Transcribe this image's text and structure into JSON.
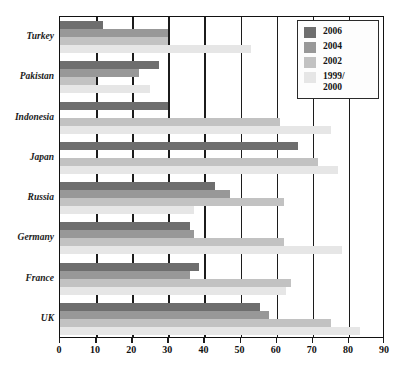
{
  "chart_data": {
    "type": "bar",
    "orientation": "horizontal",
    "title": "",
    "xlabel": "",
    "ylabel": "",
    "xlim": [
      0,
      90
    ],
    "xticks": [
      0,
      10,
      20,
      30,
      40,
      50,
      60,
      70,
      80,
      90
    ],
    "grid": true,
    "grid_axis": "x",
    "legend_position": "top-right",
    "categories": [
      "Turkey",
      "Pakistan",
      "Indonesia",
      "Japan",
      "Russia",
      "Germany",
      "France",
      "UK"
    ],
    "series": [
      {
        "name": "2006",
        "color": "#6e6e6e",
        "values": [
          12,
          27.5,
          30,
          66,
          43,
          36,
          38.5,
          55.5
        ]
      },
      {
        "name": "2004",
        "color": "#989898",
        "values": [
          30,
          22,
          0,
          0,
          47,
          37,
          36,
          58
        ]
      },
      {
        "name": "2002",
        "color": "#c2c2c2",
        "values": [
          30,
          10,
          61,
          71.5,
          62,
          62,
          64,
          75
        ]
      },
      {
        "name": "1999/\n2000",
        "color": "#e6e6e6",
        "values": [
          53,
          25,
          75,
          77,
          37,
          78,
          62.5,
          83
        ]
      }
    ]
  },
  "legend": {
    "entries": [
      {
        "label": "2006",
        "color": "#6e6e6e"
      },
      {
        "label": "2004",
        "color": "#989898"
      },
      {
        "label": "2002",
        "color": "#c2c2c2"
      },
      {
        "label": "1999/\n2000",
        "color": "#e6e6e6"
      }
    ]
  },
  "axis": {
    "x_tick_labels": [
      "0",
      "10",
      "20",
      "30",
      "40",
      "50",
      "60",
      "70",
      "80",
      "90"
    ],
    "y_tick_labels": [
      "Turkey",
      "Pakistan",
      "Indonesia",
      "Japan",
      "Russia",
      "Germany",
      "France",
      "UK"
    ]
  },
  "caption": {
    "source_text": ""
  }
}
